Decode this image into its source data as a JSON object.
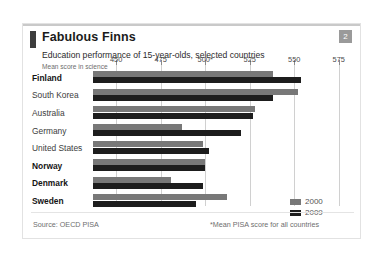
{
  "card": {
    "title": "Fabulous Finns",
    "badge": "2",
    "subtitle": "Education performance of 15-year-olds, selected countries",
    "axis_note": "Mean score in science",
    "source": "Source: OECD PISA",
    "footnote": "*Mean PISA score for all countries"
  },
  "colors": {
    "series_2000": "#787878",
    "series_2009": "#1d1d1d",
    "accent": "#3d3d3d",
    "badge": "#9a9a9a",
    "gridline": "#d0d0d0"
  },
  "chart_data": {
    "type": "bar",
    "orientation": "horizontal",
    "title": "Fabulous Finns",
    "subtitle": "Education performance of 15-year-olds, selected countries",
    "ylabel": "",
    "xlabel": "Mean score in science",
    "xlim": [
      437,
      583
    ],
    "xticks": [
      450,
      475,
      500,
      525,
      550,
      575
    ],
    "xtick_labels": [
      "450",
      "475",
      "500*",
      "525",
      "550",
      "575"
    ],
    "grid": true,
    "legend_position": "right-bottom",
    "categories": [
      "Finland",
      "South Korea",
      "Australia",
      "Germany",
      "United States",
      "Norway",
      "Denmark",
      "Sweden"
    ],
    "highlighted_categories": [
      "Finland",
      "Norway",
      "Denmark",
      "Sweden"
    ],
    "series": [
      {
        "name": "2000",
        "color": "#787878",
        "values": [
          538,
          552,
          528,
          487,
          499,
          500,
          481,
          512
        ]
      },
      {
        "name": "2009",
        "color": "#1d1d1d",
        "values": [
          554,
          538,
          527,
          520,
          502,
          500,
          499,
          495
        ]
      }
    ]
  }
}
